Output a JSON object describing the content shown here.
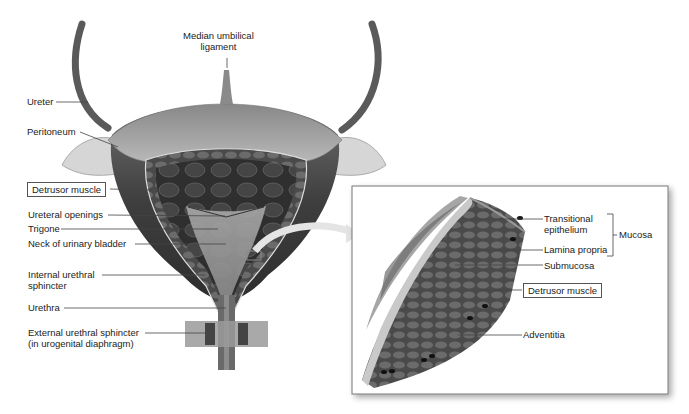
{
  "diagram": {
    "main": {
      "labels": {
        "median_umbilical_ligament": "Median umbilical\nligament",
        "median_line1": "Median umbilical",
        "median_line2": "ligament",
        "ureter": "Ureter",
        "peritoneum": "Peritoneum",
        "detrusor_muscle": "Detrusor muscle",
        "ureteral_openings": "Ureteral openings",
        "trigone": "Trigone",
        "neck": "Neck of urinary bladder",
        "internal_sphincter_line1": "Internal urethral",
        "internal_sphincter_line2": "sphincter",
        "urethra": "Urethra",
        "external_sphincter_line1": "External urethral sphincter",
        "external_sphincter_line2": "(in urogenital diaphragm)"
      }
    },
    "inset": {
      "labels": {
        "transitional_line1": "Transitional",
        "transitional_line2": "epithelium",
        "lamina_propria": "Lamina propria",
        "submucosa": "Submucosa",
        "mucosa": "Mucosa",
        "detrusor_muscle": "Detrusor muscle",
        "adventitia": "Adventitia"
      }
    },
    "colors": {
      "tissue_dark": "#3c3c3c",
      "tissue_mid": "#7a7a7a",
      "tissue_light": "#c8c8c8",
      "leader_line": "#444444",
      "inset_border": "#777777"
    }
  }
}
